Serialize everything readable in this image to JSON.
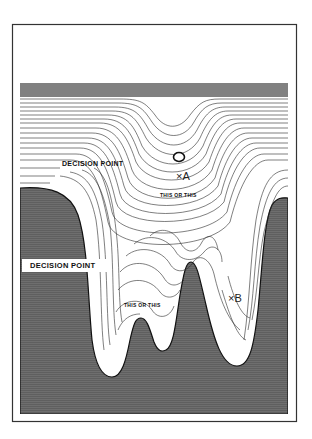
{
  "figure": {
    "type": "contour landscape diagram",
    "colors": {
      "background": "#ffffff",
      "frame": "#333333",
      "shaded_region": "#6e6e6e",
      "contour_lines": "#2a2a2a"
    },
    "labels": {
      "decision_point_upper": "DECISION POINT",
      "decision_point_lower": "DECISION POINT",
      "this_or_this_upper": "THIS OR THIS",
      "this_or_this_lower": "THIS OR THIS",
      "point_a": "×A",
      "point_b": "×B"
    },
    "markers": {
      "ball": "circle-marker"
    }
  }
}
